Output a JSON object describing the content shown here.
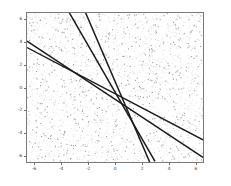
{
  "chart_data": {
    "type": "scatter",
    "title": "",
    "xlabel": "",
    "ylabel": "",
    "xlim": [
      -6.6,
      6.6
    ],
    "ylim": [
      -6.6,
      6.6
    ],
    "grid": false,
    "legend": null,
    "xticks": [
      -6,
      -4,
      -2,
      0,
      2,
      4,
      6
    ],
    "xtick_labels": [
      "-6",
      "-4",
      "-2",
      "0",
      "2",
      "4",
      "6"
    ],
    "yticks": [
      -6,
      -4,
      -2,
      0,
      2,
      4,
      6
    ],
    "ytick_labels": [
      "-6",
      "-4",
      "-2",
      "0",
      "2",
      "4",
      "6"
    ],
    "background_point_color": "#b9b9b9",
    "line_color": "#1a1a1a",
    "n_background_points": 2600,
    "series": [
      {
        "name": "line-1",
        "type": "line",
        "slope": -0.62,
        "intercept": -0.55,
        "x": [
          -6.6,
          6.6
        ],
        "y": [
          3.54,
          -4.64
        ]
      },
      {
        "name": "line-2",
        "type": "line",
        "slope": -0.78,
        "intercept": -1.05,
        "x": [
          -6.6,
          6.6
        ],
        "y": [
          4.1,
          -6.2
        ]
      },
      {
        "name": "line-3",
        "type": "line",
        "slope": -2.05,
        "intercept": -0.4,
        "x": [
          -5.4,
          3.0
        ],
        "y": [
          10.67,
          -6.55
        ]
      },
      {
        "name": "line-4",
        "type": "line",
        "slope": -2.75,
        "intercept": 0.55,
        "x": [
          -3.5,
          2.6
        ],
        "y": [
          10.18,
          -6.6
        ]
      }
    ]
  },
  "figure": {
    "width": 231,
    "height": 186,
    "facecolor": "#ffffff",
    "axes_edge_color": "#7a7a7a"
  }
}
